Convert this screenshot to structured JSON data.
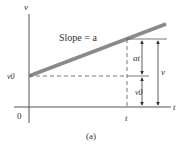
{
  "figure": {
    "caption": "(a)",
    "axes": {
      "y_label": "v",
      "x_label": "t",
      "origin_label": "0"
    },
    "line": {
      "label": "Slope = a",
      "color": "#8a8a8a"
    },
    "ticks": {
      "y_intercept_label": "v0",
      "x_point_label": "t"
    },
    "dimensions": [
      {
        "label": "at",
        "meaning": "increase in velocity over time t"
      },
      {
        "label": "v0",
        "meaning": "initial velocity"
      },
      {
        "label": "v",
        "meaning": "final velocity"
      }
    ],
    "colors": {
      "axis": "#555555",
      "line": "#8a8a8a",
      "text": "#333333"
    }
  }
}
